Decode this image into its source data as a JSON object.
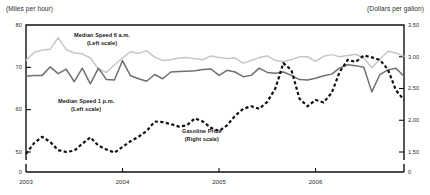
{
  "chart_data": {
    "type": "line",
    "title": "",
    "subtitle": "",
    "xlabel": "",
    "ylabel": "(Miles per hour)",
    "y2label": "(Dollars per gallon)",
    "grid": false,
    "legend_position": "inline-annotations",
    "x_tick_labels": [
      "2003",
      "2004",
      "2005",
      "2006"
    ],
    "x_tick_positions": [
      0,
      12,
      24,
      36
    ],
    "xlim": [
      0,
      47
    ],
    "left_axis": {
      "unit_label": "(Miles per hour)",
      "tick_labels": [
        "80",
        "70",
        "60",
        "50",
        "0"
      ],
      "tick_values": [
        80,
        70,
        60,
        50,
        0
      ],
      "ylim": [
        45,
        80
      ],
      "broken_axis": true
    },
    "right_axis": {
      "unit_label": "(Dollars per gallon)",
      "tick_labels": [
        "3.50",
        "3.00",
        "2.50",
        "2.00",
        "1.50",
        "0"
      ],
      "tick_values": [
        3.5,
        3.0,
        2.5,
        2.0,
        1.5,
        0
      ],
      "ylim": [
        1.3,
        3.5
      ],
      "broken_axis": true
    },
    "annotations": [
      {
        "name": "median-speed-6am",
        "line1": "Median Speed 6 a.m.",
        "line2": "(Left scale)"
      },
      {
        "name": "median-speed-1pm",
        "line1": "Median Speed 1 p.m.",
        "line2": "(Left scale)"
      },
      {
        "name": "gasoline-price",
        "line1": "Gasoline Price",
        "line2": "(Right scale)"
      }
    ],
    "series": [
      {
        "name": "Median Speed 6 a.m.",
        "axis": "left",
        "style": "solid",
        "color": "#c6c6c6",
        "values": [
          71.6,
          73.5,
          74.1,
          74.3,
          77.0,
          74.2,
          73.4,
          73.2,
          72.2,
          69.6,
          68.8,
          70.6,
          72.2,
          73.7,
          73.3,
          73.9,
          72.4,
          71.6,
          71.8,
          72.2,
          72.3,
          72.0,
          71.8,
          72.7,
          72.3,
          72.1,
          72.2,
          71.0,
          71.6,
          72.3,
          72.7,
          71.6,
          71.4,
          71.8,
          72.5,
          72.5,
          71.4,
          72.6,
          73.0,
          72.5,
          72.8,
          73.1,
          72.2,
          69.9,
          71.9,
          73.8,
          73.4,
          72.6
        ]
      },
      {
        "name": "Median Speed 1 p.m.",
        "axis": "left",
        "style": "solid",
        "color": "#6f6f6f",
        "values": [
          67.9,
          68.1,
          68.1,
          70.1,
          68.5,
          69.6,
          66.6,
          69.8,
          66.1,
          69.8,
          67.1,
          67.0,
          71.6,
          68.0,
          67.3,
          66.7,
          68.3,
          67.3,
          68.9,
          69.0,
          69.1,
          69.2,
          69.5,
          69.6,
          68.1,
          69.3,
          68.9,
          67.8,
          68.1,
          69.8,
          68.8,
          68.6,
          68.9,
          68.1,
          67.1,
          67.0,
          67.4,
          68.0,
          68.4,
          69.8,
          70.6,
          70.4,
          70.0,
          64.2,
          68.3,
          69.4,
          69.8,
          67.9
        ]
      },
      {
        "name": "Gasoline Price",
        "axis": "right",
        "style": "dashed",
        "color": "#111111",
        "values": [
          1.47,
          1.64,
          1.74,
          1.66,
          1.53,
          1.5,
          1.52,
          1.63,
          1.73,
          1.6,
          1.54,
          1.49,
          1.58,
          1.67,
          1.74,
          1.83,
          1.98,
          1.97,
          1.94,
          1.9,
          1.92,
          2.03,
          1.98,
          1.88,
          1.83,
          1.92,
          2.07,
          2.18,
          2.22,
          2.18,
          2.29,
          2.5,
          2.9,
          2.79,
          2.34,
          2.22,
          2.32,
          2.28,
          2.43,
          2.76,
          2.95,
          2.92,
          3.02,
          2.99,
          2.95,
          2.8,
          2.47,
          2.32
        ]
      }
    ]
  }
}
